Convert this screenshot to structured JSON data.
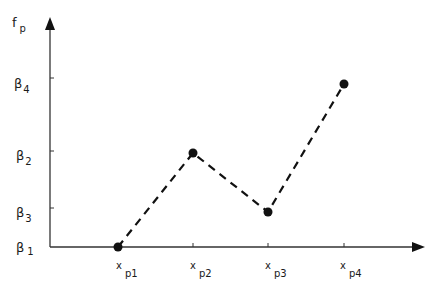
{
  "diagram": {
    "y_axis_label": {
      "main": "f",
      "sub": "p"
    },
    "y_ticks": [
      {
        "main": "β",
        "sub": "4",
        "y": 78
      },
      {
        "main": "β",
        "sub": "2",
        "y": 151
      },
      {
        "main": "β",
        "sub": "3",
        "y": 208
      },
      {
        "main": "β",
        "sub": "1",
        "y": 247
      }
    ],
    "x_ticks": [
      {
        "main": "x",
        "sub": "p1",
        "x": 118
      },
      {
        "main": "x",
        "sub": "p2",
        "x": 193
      },
      {
        "main": "x",
        "sub": "p3",
        "x": 268
      },
      {
        "main": "x",
        "sub": "p4",
        "x": 344
      }
    ],
    "points": [
      {
        "x": 118,
        "y": 247,
        "label": "(x_p1, β1)"
      },
      {
        "x": 193,
        "y": 153,
        "label": "(x_p2, β2)"
      },
      {
        "x": 268,
        "y": 212,
        "label": "(x_p3, β3)"
      },
      {
        "x": 344,
        "y": 84,
        "label": "(x_p4, β4)"
      }
    ],
    "line_style": "dashed",
    "color": "#1a1a1a"
  }
}
